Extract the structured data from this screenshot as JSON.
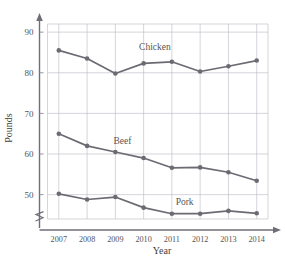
{
  "chart_data": {
    "type": "line",
    "title": "",
    "xlabel": "Year",
    "ylabel": "Pounds",
    "categories": [
      2007,
      2008,
      2009,
      2010,
      2011,
      2012,
      2013,
      2014
    ],
    "x_tick_labels": [
      "2007",
      "2008",
      "2009",
      "2010",
      "2011",
      "2012",
      "2013",
      "2014"
    ],
    "y_tick_labels": [
      "50",
      "60",
      "70",
      "80",
      "90"
    ],
    "y_ticks": [
      50,
      60,
      70,
      80,
      90
    ],
    "ylim": [
      44,
      92
    ],
    "xlim": [
      2006.6,
      2014.4
    ],
    "grid": true,
    "legend": "inline-labels",
    "y_axis_break": true,
    "series": [
      {
        "name": "Chicken",
        "color": "#6b6b73",
        "label_x": 2010.4,
        "label_y": 85.6,
        "values": [
          85.5,
          83.5,
          79.8,
          82.3,
          82.7,
          80.3,
          81.6,
          83.0
        ]
      },
      {
        "name": "Beef",
        "color": "#6b6b73",
        "label_x": 2009.25,
        "label_y": 62.4,
        "values": [
          65.0,
          62.0,
          60.5,
          59.0,
          56.6,
          56.7,
          55.5,
          53.4
        ]
      },
      {
        "name": "Pork",
        "color": "#6b6b73",
        "label_x": 2011.45,
        "label_y": 47.4,
        "values": [
          50.2,
          48.8,
          49.4,
          46.8,
          45.3,
          45.3,
          46.0,
          45.4
        ]
      }
    ]
  },
  "axes": {
    "y_label_text": "Pounds",
    "x_label_text": "Year"
  }
}
